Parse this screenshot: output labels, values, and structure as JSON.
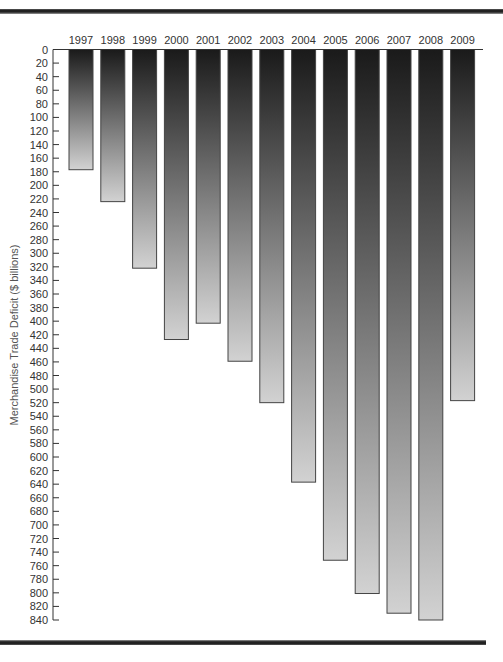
{
  "chart_data": {
    "type": "bar",
    "orientation": "vertical-inverted",
    "title": "",
    "xlabel": "",
    "ylabel": "Merchandise Trade Deficit ($ billions)",
    "categories": [
      "1997",
      "1998",
      "1999",
      "2000",
      "2001",
      "2002",
      "2003",
      "2004",
      "2005",
      "2006",
      "2007",
      "2008",
      "2009"
    ],
    "values": [
      177,
      224,
      322,
      427,
      403,
      459,
      520,
      637,
      752,
      801,
      830,
      840,
      517
    ],
    "ylim": [
      0,
      840
    ],
    "yticks": [
      0,
      20,
      40,
      60,
      80,
      100,
      120,
      140,
      160,
      180,
      200,
      220,
      240,
      260,
      280,
      300,
      320,
      340,
      360,
      380,
      400,
      420,
      440,
      460,
      480,
      500,
      520,
      540,
      560,
      580,
      600,
      620,
      640,
      660,
      680,
      700,
      720,
      740,
      760,
      780,
      800,
      820,
      840
    ],
    "y_axis_direction": "downward",
    "category_labels_position": "top",
    "grid": false,
    "legend": "none",
    "bar_fill": "vertical gradient dark-to-light",
    "colors": {
      "bar_top": "#1a1a1a",
      "bar_bottom": "#d2d2d2",
      "bar_stroke": "#444444",
      "axis": "#333333"
    }
  }
}
